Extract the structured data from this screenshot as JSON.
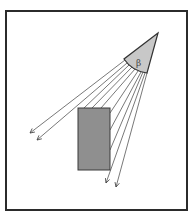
{
  "diagram": {
    "title": "",
    "frame": {
      "x": 6,
      "y": 11,
      "width": 181,
      "height": 199,
      "stroke": "#2b2b2b"
    },
    "source": {
      "apex": [
        158,
        33
      ],
      "arc_start": [
        124,
        59
      ],
      "arc_end": [
        147,
        73
      ],
      "fill": "#c8c8c8",
      "stroke": "#333333",
      "symbol": "β"
    },
    "obstacle": {
      "x": 78,
      "y": 108,
      "width": 32,
      "height": 62,
      "fill": "#8f8f8f",
      "stroke": "#3a3a3a"
    },
    "rays": [
      {
        "from": [
          125,
          60
        ],
        "to": [
          30,
          133
        ],
        "arrow": true
      },
      {
        "from": [
          127,
          63
        ],
        "to": [
          37,
          140
        ],
        "arrow": true
      },
      {
        "from": [
          129,
          65
        ],
        "to": [
          84,
          108
        ],
        "arrow": false
      },
      {
        "from": [
          132,
          67
        ],
        "to": [
          92,
          108
        ],
        "arrow": false
      },
      {
        "from": [
          135,
          69
        ],
        "to": [
          101,
          108
        ],
        "arrow": false
      },
      {
        "from": [
          138,
          71
        ],
        "to": [
          110,
          113
        ],
        "arrow": false
      },
      {
        "from": [
          141,
          72
        ],
        "to": [
          110,
          130
        ],
        "arrow": false
      },
      {
        "from": [
          143,
          72
        ],
        "to": [
          110,
          150
        ],
        "arrow": false
      },
      {
        "from": [
          145,
          73
        ],
        "to": [
          106,
          183
        ],
        "arrow": true
      },
      {
        "from": [
          147,
          73
        ],
        "to": [
          116,
          187
        ],
        "arrow": true
      }
    ],
    "ray_color": "#555555"
  }
}
